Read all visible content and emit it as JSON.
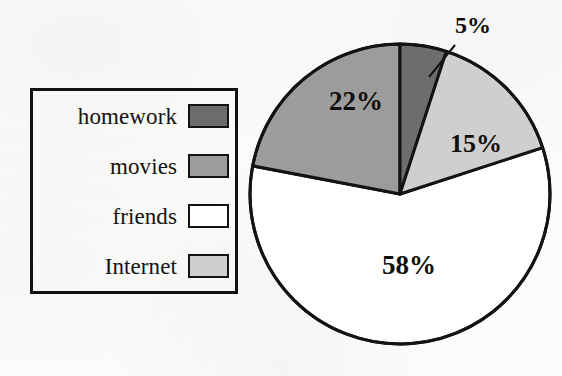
{
  "legend": {
    "items": [
      {
        "label": "homework",
        "color": "#6d6d6d",
        "swatch_name": "homework"
      },
      {
        "label": "movies",
        "color": "#9c9c9c",
        "swatch_name": "movies"
      },
      {
        "label": "friends",
        "color": "#ffffff",
        "swatch_name": "friends"
      },
      {
        "label": "Internet",
        "color": "#cfcfcf",
        "swatch_name": "internet"
      }
    ]
  },
  "labels": {
    "homework": "5%",
    "movies": "22%",
    "internet": "15%",
    "friends": "58%"
  },
  "chart_data": {
    "type": "pie",
    "title": "",
    "categories": [
      "homework",
      "movies",
      "friends",
      "Internet"
    ],
    "values": [
      5,
      22,
      58,
      15
    ],
    "value_labels": [
      "5%",
      "22%",
      "58%",
      "15%"
    ],
    "colors": [
      "#6d6d6d",
      "#9c9c9c",
      "#ffffff",
      "#cfcfcf"
    ],
    "units": "percent",
    "total": 100,
    "legend_position": "left",
    "grid": false,
    "start_angle_deg": 0,
    "direction": "clockwise",
    "slice_order_clockwise_from_top": [
      "homework",
      "Internet",
      "friends",
      "movies"
    ],
    "external_label_slices": [
      "homework"
    ]
  }
}
